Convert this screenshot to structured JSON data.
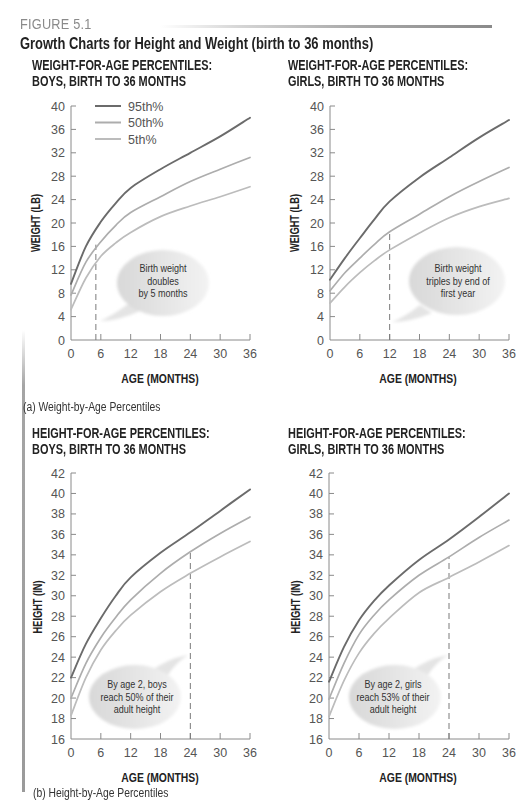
{
  "figure": {
    "label": "FIGURE 5.1",
    "title": "Growth Charts for Height and Weight (birth to 36 months)"
  },
  "captions": {
    "a": "(a) Weight-by-Age Percentiles",
    "b": "(b) Height-by-Age Percentiles"
  },
  "colors": {
    "p95": "#6b6b6b",
    "p50": "#adadad",
    "p5": "#bcbcbc",
    "axis": "#8a8a8a",
    "tick_text": "#555555",
    "marker": "#7a7a7a",
    "figure_label": "#8a8a8a"
  },
  "legend": [
    {
      "label": "95th%",
      "series": "p95"
    },
    {
      "label": "50th%",
      "series": "p50"
    },
    {
      "label": "5th%",
      "series": "p5"
    }
  ],
  "chart_data": [
    {
      "type": "line",
      "title": [
        "WEIGHT-FOR-AGE PERCENTILES:",
        "BOYS, BIRTH TO 36 MONTHS"
      ],
      "xlabel": "AGE (MONTHS)",
      "ylabel": "WEIGHT (LB)",
      "xlim": [
        0,
        36
      ],
      "ylim": [
        0,
        40
      ],
      "xticks": [
        0,
        6,
        12,
        18,
        24,
        30,
        36
      ],
      "yticks": [
        0,
        4,
        8,
        12,
        16,
        20,
        24,
        28,
        32,
        36,
        40
      ],
      "grid": false,
      "legend_position": "top-left (inside)",
      "x": [
        0,
        3,
        6,
        9,
        12,
        18,
        24,
        30,
        36
      ],
      "series": [
        {
          "name": "95th%",
          "key": "p95",
          "values": [
            9.6,
            16.0,
            20.2,
            23.4,
            26.0,
            29.2,
            32.0,
            34.8,
            38.0
          ]
        },
        {
          "name": "50th%",
          "key": "p50",
          "values": [
            7.7,
            13.3,
            16.8,
            19.6,
            21.8,
            24.5,
            27.1,
            29.2,
            31.2
          ]
        },
        {
          "name": "5th%",
          "key": "p5",
          "values": [
            5.2,
            10.6,
            14.3,
            16.6,
            18.4,
            21.1,
            22.9,
            24.5,
            26.2
          ]
        }
      ],
      "annotation": {
        "lines": [
          "Birth weight",
          "doubles",
          "by 5 months"
        ],
        "marker_x": 5,
        "marker_y": 16.3
      }
    },
    {
      "type": "line",
      "title": [
        "WEIGHT-FOR-AGE PERCENTILES:",
        "GIRLS, BIRTH TO 36 MONTHS"
      ],
      "xlabel": "AGE (MONTHS)",
      "ylabel": "WEIGHT (LB)",
      "xlim": [
        0,
        36
      ],
      "ylim": [
        0,
        40
      ],
      "xticks": [
        0,
        6,
        12,
        18,
        24,
        30,
        36
      ],
      "yticks": [
        0,
        4,
        8,
        12,
        16,
        20,
        24,
        28,
        32,
        36,
        40
      ],
      "grid": false,
      "x": [
        0,
        3,
        6,
        9,
        12,
        18,
        24,
        30,
        36
      ],
      "series": [
        {
          "name": "95th%",
          "key": "p95",
          "values": [
            10.3,
            14.0,
            17.4,
            20.7,
            23.7,
            27.8,
            31.2,
            34.6,
            37.6
          ]
        },
        {
          "name": "50th%",
          "key": "p50",
          "values": [
            8.4,
            11.5,
            14.0,
            16.4,
            18.5,
            21.5,
            24.5,
            27.1,
            29.5
          ]
        },
        {
          "name": "5th%",
          "key": "p5",
          "values": [
            6.3,
            9.1,
            11.5,
            13.6,
            15.4,
            18.3,
            20.9,
            22.8,
            24.2
          ]
        }
      ],
      "annotation": {
        "lines": [
          "Birth weight",
          "triples by end of",
          "first year"
        ],
        "marker_x": 12,
        "marker_y": 18.5
      }
    },
    {
      "type": "line",
      "title": [
        "HEIGHT-FOR-AGE PERCENTILES:",
        "BOYS, BIRTH TO 36 MONTHS"
      ],
      "xlabel": "AGE (MONTHS)",
      "ylabel": "HEIGHT (IN)",
      "xlim": [
        0,
        36
      ],
      "ylim": [
        16,
        42
      ],
      "xticks": [
        0,
        6,
        12,
        18,
        24,
        30,
        36
      ],
      "yticks": [
        16,
        18,
        20,
        22,
        24,
        26,
        28,
        30,
        32,
        34,
        36,
        38,
        40,
        42
      ],
      "grid": false,
      "x": [
        0,
        3,
        6,
        9,
        12,
        18,
        24,
        30,
        36
      ],
      "series": [
        {
          "name": "95th%",
          "key": "p95",
          "values": [
            22.0,
            25.3,
            27.8,
            30.0,
            31.8,
            34.2,
            36.2,
            38.3,
            40.4
          ]
        },
        {
          "name": "50th%",
          "key": "p50",
          "values": [
            20.0,
            23.4,
            25.9,
            27.9,
            29.6,
            32.2,
            34.3,
            36.1,
            37.7
          ]
        },
        {
          "name": "5th%",
          "key": "p5",
          "values": [
            18.3,
            22.0,
            24.7,
            26.6,
            28.1,
            30.4,
            32.2,
            33.8,
            35.3
          ]
        }
      ],
      "annotation": {
        "lines": [
          "By age 2, boys",
          "reach 50% of their",
          "adult height"
        ],
        "marker_x": 24,
        "marker_y": 34.3
      }
    },
    {
      "type": "line",
      "title": [
        "HEIGHT-FOR-AGE PERCENTILES:",
        "GIRLS, BIRTH TO 36 MONTHS"
      ],
      "xlabel": "AGE (MONTHS)",
      "ylabel": "HEIGHT (IN)",
      "xlim": [
        0,
        36
      ],
      "ylim": [
        16,
        42
      ],
      "xticks": [
        0,
        6,
        12,
        18,
        24,
        30,
        36
      ],
      "yticks": [
        16,
        18,
        20,
        22,
        24,
        26,
        28,
        30,
        32,
        34,
        36,
        38,
        40,
        42
      ],
      "grid": false,
      "x": [
        0,
        3,
        6,
        9,
        12,
        18,
        24,
        30,
        36
      ],
      "series": [
        {
          "name": "95th%",
          "key": "p95",
          "values": [
            21.6,
            25.0,
            27.6,
            29.5,
            31.0,
            33.5,
            35.5,
            37.7,
            40.0
          ]
        },
        {
          "name": "50th%",
          "key": "p50",
          "values": [
            19.9,
            23.4,
            26.2,
            28.1,
            29.6,
            32.0,
            33.8,
            35.7,
            37.4
          ]
        },
        {
          "name": "5th%",
          "key": "p5",
          "values": [
            18.2,
            21.7,
            24.4,
            26.3,
            27.8,
            30.3,
            31.8,
            33.3,
            34.9
          ]
        }
      ],
      "annotation": {
        "lines": [
          "By age 2, girls",
          "reach 53% of their",
          "adult height"
        ],
        "marker_x": 24,
        "marker_y": 33.8
      }
    }
  ]
}
